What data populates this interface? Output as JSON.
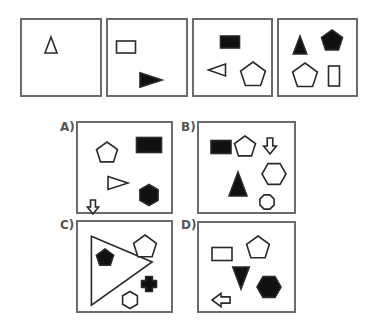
{
  "colors": {
    "stroke": "#2a2a2a",
    "fill_black": "#111111",
    "border": "#6b6b6b",
    "label": "#555555"
  },
  "sequence": [
    {
      "id": "seq-1",
      "x": 20,
      "y": 18,
      "w": 82,
      "h": 79,
      "shapes": [
        {
          "type": "triangle-up",
          "fill": "outline",
          "cx": 29,
          "cy": 25,
          "size": 16
        }
      ]
    },
    {
      "id": "seq-2",
      "x": 106,
      "y": 18,
      "w": 82,
      "h": 79,
      "shapes": [
        {
          "type": "rectangle",
          "fill": "outline",
          "cx": 18,
          "cy": 27,
          "w": 19,
          "h": 12
        },
        {
          "type": "triangle-right",
          "fill": "black",
          "cx": 43,
          "cy": 60,
          "size": 22
        }
      ]
    },
    {
      "id": "seq-3",
      "x": 192,
      "y": 18,
      "w": 81,
      "h": 79,
      "shapes": [
        {
          "type": "rectangle",
          "fill": "black",
          "cx": 36,
          "cy": 22,
          "w": 19,
          "h": 12
        },
        {
          "type": "triangle-left",
          "fill": "outline",
          "cx": 23,
          "cy": 50,
          "size": 17
        },
        {
          "type": "pentagon",
          "fill": "outline",
          "cx": 59,
          "cy": 55,
          "size": 26
        }
      ]
    },
    {
      "id": "seq-4",
      "x": 277,
      "y": 18,
      "w": 81,
      "h": 79,
      "shapes": [
        {
          "type": "triangle-up",
          "fill": "black",
          "cx": 21,
          "cy": 25,
          "size": 18
        },
        {
          "type": "pentagon",
          "fill": "black",
          "cx": 53,
          "cy": 21,
          "size": 22
        },
        {
          "type": "pentagon",
          "fill": "outline",
          "cx": 26,
          "cy": 56,
          "size": 26
        },
        {
          "type": "rectangle",
          "fill": "outline",
          "cx": 55,
          "cy": 56,
          "w": 11,
          "h": 20
        }
      ]
    }
  ],
  "options": [
    {
      "label": "A)",
      "label_x": 60,
      "label_y": 120,
      "x": 76,
      "y": 121,
      "w": 97,
      "h": 93,
      "shapes": [
        {
          "type": "pentagon",
          "fill": "outline",
          "cx": 29,
          "cy": 30,
          "size": 22
        },
        {
          "type": "rectangle",
          "fill": "black",
          "cx": 71,
          "cy": 22,
          "w": 25,
          "h": 15
        },
        {
          "type": "triangle-right",
          "fill": "outline",
          "cx": 40,
          "cy": 60,
          "size": 20
        },
        {
          "type": "hexagon",
          "fill": "black",
          "cx": 71,
          "cy": 72,
          "size": 21
        },
        {
          "type": "arrow-down",
          "fill": "outline",
          "cx": 15,
          "cy": 84,
          "size": 14
        }
      ]
    },
    {
      "label": "B)",
      "label_x": 181,
      "label_y": 120,
      "x": 197,
      "y": 121,
      "w": 99,
      "h": 93,
      "shapes": [
        {
          "type": "rectangle",
          "fill": "black",
          "cx": 22,
          "cy": 24,
          "w": 20,
          "h": 13
        },
        {
          "type": "pentagon",
          "fill": "outline",
          "cx": 46,
          "cy": 24,
          "size": 22
        },
        {
          "type": "arrow-down",
          "fill": "outline",
          "cx": 71,
          "cy": 23,
          "size": 16
        },
        {
          "type": "triangle-up",
          "fill": "black",
          "cx": 39,
          "cy": 61,
          "size": 24
        },
        {
          "type": "hexagon-wide",
          "fill": "outline",
          "cx": 75,
          "cy": 51,
          "size": 24
        },
        {
          "type": "octagon-blob",
          "fill": "outline",
          "cx": 68,
          "cy": 79,
          "size": 18
        }
      ]
    },
    {
      "label": "C)",
      "label_x": 60,
      "label_y": 218,
      "x": 76,
      "y": 220,
      "w": 97,
      "h": 93,
      "shapes": [
        {
          "type": "triangle-right-big",
          "fill": "outline",
          "cx": 35,
          "cy": 40,
          "size": 54
        },
        {
          "type": "pentagon",
          "fill": "black",
          "cx": 27,
          "cy": 36,
          "size": 18
        },
        {
          "type": "pentagon",
          "fill": "outline",
          "cx": 67,
          "cy": 25,
          "size": 24
        },
        {
          "type": "cross-blob",
          "fill": "black",
          "cx": 71,
          "cy": 62,
          "size": 15
        },
        {
          "type": "hexagon",
          "fill": "outline",
          "cx": 52,
          "cy": 78,
          "size": 17
        }
      ]
    },
    {
      "label": "D)",
      "label_x": 181,
      "label_y": 218,
      "x": 197,
      "y": 221,
      "w": 99,
      "h": 92,
      "shapes": [
        {
          "type": "rectangle",
          "fill": "outline",
          "cx": 23,
          "cy": 31,
          "w": 20,
          "h": 13
        },
        {
          "type": "pentagon",
          "fill": "outline",
          "cx": 59,
          "cy": 25,
          "size": 24
        },
        {
          "type": "triangle-down",
          "fill": "black",
          "cx": 42,
          "cy": 55,
          "size": 22
        },
        {
          "type": "hexagon-wide",
          "fill": "black",
          "cx": 70,
          "cy": 64,
          "size": 24
        },
        {
          "type": "arrow-left",
          "fill": "outline",
          "cx": 22,
          "cy": 77,
          "size": 18
        }
      ]
    }
  ]
}
